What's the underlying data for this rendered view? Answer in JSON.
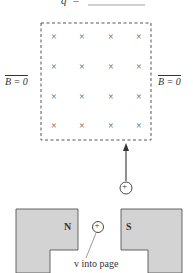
{
  "header": {
    "variable": "q",
    "equals": "="
  },
  "field_region": {
    "mark": "×",
    "rows": 4,
    "cols": 4,
    "left_label": "B = 0",
    "right_label": "B = 0"
  },
  "charge": {
    "symbol": "+"
  },
  "magnet": {
    "north_label": "N",
    "south_label": "S",
    "charge_symbol": "+",
    "velocity_label": "v into page"
  },
  "colors": {
    "magnet_fill": "#d3d3d3",
    "stroke": "#333333"
  }
}
